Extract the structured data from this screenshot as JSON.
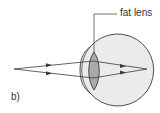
{
  "diagram": {
    "panel_label": "b)",
    "lens_label": "fat lens",
    "colors": {
      "eye_fill": "#ebebeb",
      "lens_fill": "#aaaaaa",
      "stroke": "#3a3a3a",
      "background": "#ffffff"
    },
    "elements": [
      "object point",
      "two light rays",
      "eyeball",
      "cornea",
      "fat lens",
      "focus point on retina"
    ]
  }
}
